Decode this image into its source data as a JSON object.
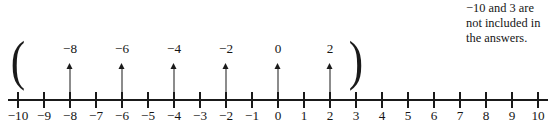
{
  "figure": {
    "annotation": {
      "lines": [
        "−10 and 3 are",
        "not included in",
        "the answers."
      ]
    },
    "axis": {
      "min": -10,
      "max": 10,
      "step": 1,
      "origin_px": 278,
      "unit_px": 26,
      "line_left_px": 8,
      "line_right_px": 548,
      "tick_labels": [
        "−10",
        "−9",
        "−8",
        "−7",
        "−6",
        "−5",
        "−4",
        "−3",
        "−2",
        "−1",
        "0",
        "1",
        "2",
        "3",
        "4",
        "5",
        "6",
        "7",
        "8",
        "9",
        "10"
      ],
      "tick_values": [
        -10,
        -9,
        -8,
        -7,
        -6,
        -5,
        -4,
        -3,
        -2,
        -1,
        0,
        1,
        2,
        3,
        4,
        5,
        6,
        7,
        8,
        9,
        10
      ]
    },
    "callouts": [
      {
        "value": -8,
        "label": "−8"
      },
      {
        "value": -6,
        "label": "−6"
      },
      {
        "value": -4,
        "label": "−4"
      },
      {
        "value": -2,
        "label": "−2"
      },
      {
        "value": 0,
        "label": "0"
      },
      {
        "value": 2,
        "label": "2"
      }
    ],
    "interval": {
      "open_paren": "(",
      "close_paren": ")",
      "open_value": -10,
      "close_value": 3,
      "notation": "(−10, 3)"
    },
    "colors": {
      "ink": "#1a1a1a",
      "background": "#ffffff"
    }
  },
  "chart_data": {
    "type": "line",
    "xlabel": "",
    "ylabel": "",
    "xlim": [
      -10,
      10
    ],
    "grid": false,
    "x": [
      -10,
      -9,
      -8,
      -7,
      -6,
      -5,
      -4,
      -3,
      -2,
      -1,
      0,
      1,
      2,
      3,
      4,
      5,
      6,
      7,
      8,
      9,
      10
    ],
    "tick_labels": [
      "−10",
      "−9",
      "−8",
      "−7",
      "−6",
      "−5",
      "−4",
      "−3",
      "−2",
      "−1",
      "0",
      "1",
      "2",
      "3",
      "4",
      "5",
      "6",
      "7",
      "8",
      "9",
      "10"
    ],
    "annotations": [
      {
        "text": "−10 and 3 are not included in the answers.",
        "position": "top-right"
      },
      {
        "text": "(",
        "x": -10,
        "position": "above-axis"
      },
      {
        "text": ")",
        "x": 3,
        "position": "above-axis"
      }
    ],
    "marked_points": [
      -8,
      -6,
      -4,
      -2,
      0,
      2
    ],
    "marked_point_labels": [
      "−8",
      "−6",
      "−4",
      "−2",
      "0",
      "2"
    ],
    "interval": {
      "lower": -10,
      "upper": 3,
      "lower_closed": false,
      "upper_closed": false
    }
  }
}
